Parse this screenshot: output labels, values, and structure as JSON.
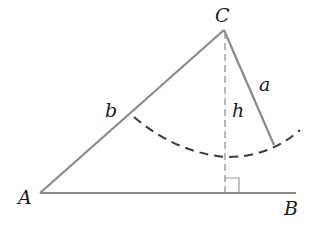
{
  "diagram": {
    "type": "triangle-ambiguous-case",
    "colors": {
      "line": "#8a8a8a",
      "dashed_arc": "#3a3a3a",
      "altitude": "#9a9a9a",
      "text": "#1a1a1a",
      "background": "#ffffff"
    },
    "vertices": {
      "A": {
        "label": "A"
      },
      "B": {
        "label": "B"
      },
      "C": {
        "label": "C"
      }
    },
    "sides": {
      "a": {
        "label": "a"
      },
      "b": {
        "label": "b"
      },
      "h": {
        "label": "h"
      }
    },
    "annotations": [
      "right-angle marker at foot of altitude",
      "dashed arc of radius a centered at C"
    ]
  }
}
